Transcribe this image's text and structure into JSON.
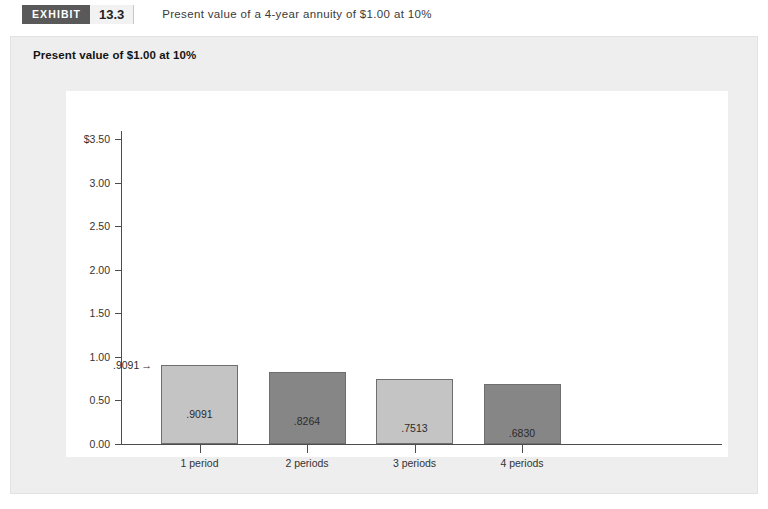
{
  "exhibit": {
    "badge_label": "EXHIBIT",
    "number": "13.3",
    "caption": "Present value of a 4-year annuity of $1.00 at 10%"
  },
  "panel": {
    "title": "Present value of $1.00 at 10%"
  },
  "chart_data": {
    "type": "bar",
    "title": "Present value of $1.00 at 10%",
    "xlabel": "",
    "ylabel": "",
    "ylim": [
      0.0,
      3.5
    ],
    "grid": false,
    "legend": "none",
    "categories": [
      "1 period",
      "2 periods",
      "3 periods",
      "4 periods"
    ],
    "values": [
      0.9091,
      0.8264,
      0.7513,
      0.683
    ],
    "bar_labels": [
      ".9091",
      ".8264",
      ".7513",
      ".6830"
    ],
    "bar_colors": [
      "#c4c4c4",
      "#868686",
      "#c4c4c4",
      "#868686"
    ],
    "ytick_labels": [
      "$3.50",
      "3.00",
      "2.50",
      "2.00",
      "1.50",
      "1.00",
      "0.50",
      "0.00"
    ],
    "ytick_values": [
      3.5,
      3.0,
      2.5,
      2.0,
      1.5,
      1.0,
      0.5,
      0.0
    ],
    "annotations": [
      {
        "text": ".9091",
        "arrow": "→",
        "points_to": "1 period"
      }
    ]
  },
  "colors": {
    "badge_bg": "#595959",
    "panel_bg": "#eeeeee",
    "plot_bg": "#ffffff",
    "bar_light": "#c4c4c4",
    "bar_dark": "#868686",
    "axis": "#4d4d4d"
  }
}
